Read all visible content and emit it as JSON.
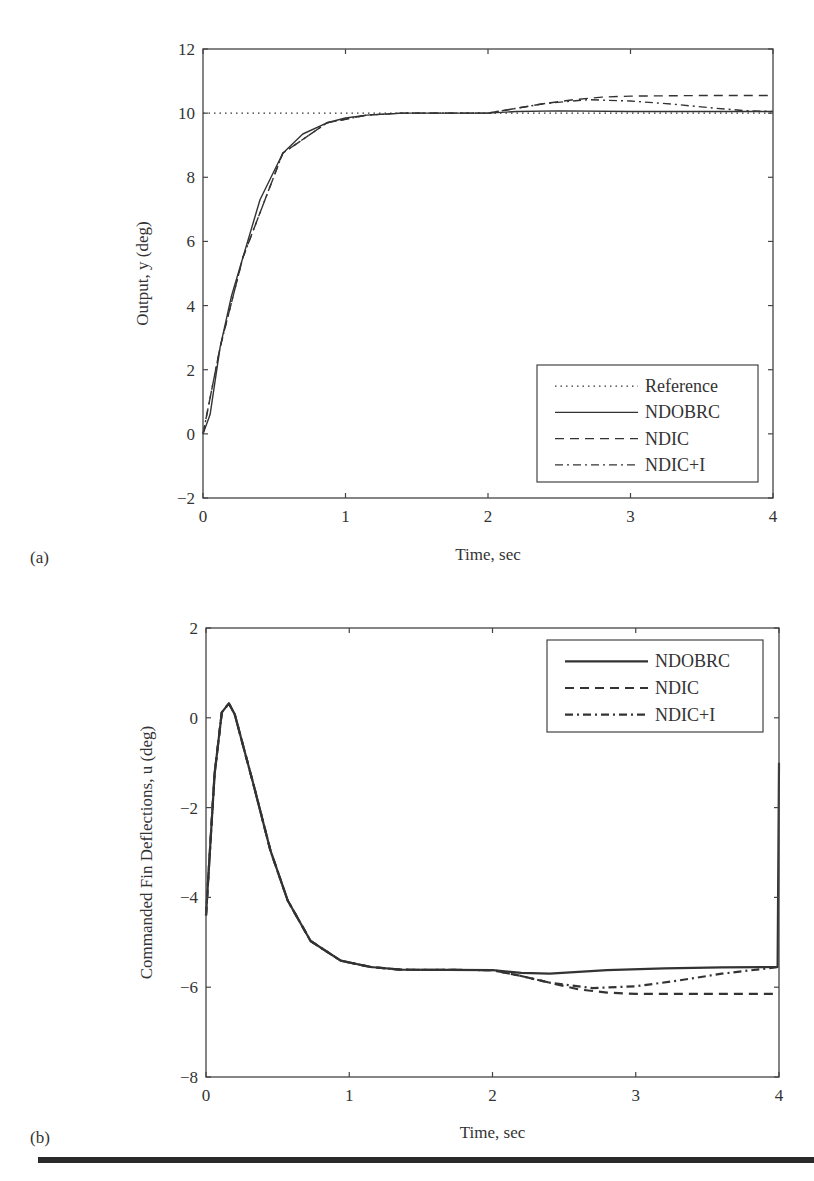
{
  "chart_data": [
    {
      "type": "line",
      "panel_label": "(a)",
      "title": "",
      "xlabel": "Time, sec",
      "ylabel": "Output, y (deg)",
      "xlim": [
        0,
        4
      ],
      "ylim": [
        -2,
        12
      ],
      "xticks": [
        "0",
        "1",
        "2",
        "3",
        "4"
      ],
      "yticks": [
        "-2",
        "0",
        "2",
        "4",
        "6",
        "8",
        "10",
        "12"
      ],
      "grid": false,
      "legend_position": "lower right",
      "series": [
        {
          "name": "Reference",
          "style": "dotted",
          "x": [
            0,
            4
          ],
          "y": [
            10,
            10
          ]
        },
        {
          "name": "NDOBRC",
          "style": "solid",
          "x": [
            0,
            0.05,
            0.12,
            0.2,
            0.28,
            0.4,
            0.56,
            0.7,
            0.87,
            1.0,
            1.15,
            1.4,
            2.0,
            2.2,
            2.5,
            3.0,
            4.0
          ],
          "y": [
            0,
            0.6,
            2.7,
            4.3,
            5.5,
            7.3,
            8.75,
            9.35,
            9.7,
            9.85,
            9.94,
            10.0,
            10.0,
            10.05,
            10.07,
            10.05,
            10.05
          ]
        },
        {
          "name": "NDIC",
          "style": "dashed",
          "x": [
            0,
            0.12,
            0.28,
            0.56,
            0.87,
            1.15,
            1.4,
            2.0,
            2.2,
            2.4,
            2.6,
            2.8,
            3.0,
            3.5,
            4.0
          ],
          "y": [
            0,
            2.7,
            5.5,
            8.75,
            9.7,
            9.94,
            10.0,
            10.0,
            10.15,
            10.3,
            10.42,
            10.5,
            10.53,
            10.55,
            10.55
          ]
        },
        {
          "name": "NDIC+I",
          "style": "dashdot",
          "x": [
            0,
            0.12,
            0.28,
            0.56,
            0.87,
            1.15,
            1.4,
            2.0,
            2.2,
            2.4,
            2.7,
            3.0,
            3.3,
            3.6,
            3.8,
            4.0
          ],
          "y": [
            0,
            2.7,
            5.5,
            8.75,
            9.7,
            9.94,
            10.0,
            10.0,
            10.15,
            10.3,
            10.42,
            10.38,
            10.28,
            10.15,
            10.08,
            10.05
          ]
        }
      ]
    },
    {
      "type": "line",
      "panel_label": "(b)",
      "title": "",
      "xlabel": "Time, sec",
      "ylabel": "Commanded Fin Deflections, u (deg)",
      "xlim": [
        0,
        4
      ],
      "ylim": [
        -8,
        2
      ],
      "xticks": [
        "0",
        "1",
        "2",
        "3",
        "4"
      ],
      "yticks": [
        "-8",
        "-6",
        "-4",
        "-2",
        "0",
        "2"
      ],
      "grid": false,
      "legend_position": "upper right",
      "series": [
        {
          "name": "NDOBRC",
          "style": "solid",
          "x": [
            0,
            0.06,
            0.11,
            0.16,
            0.2,
            0.33,
            0.45,
            0.57,
            0.73,
            0.94,
            1.15,
            1.36,
            2.0,
            2.2,
            2.4,
            2.8,
            3.2,
            3.6,
            3.99,
            4.0
          ],
          "y": [
            -4.4,
            -1.25,
            0.12,
            0.32,
            0.08,
            -1.47,
            -2.96,
            -4.07,
            -4.97,
            -5.41,
            -5.55,
            -5.61,
            -5.62,
            -5.68,
            -5.7,
            -5.62,
            -5.58,
            -5.56,
            -5.55,
            -1.0
          ]
        },
        {
          "name": "NDIC",
          "style": "dashed",
          "x": [
            0,
            0.06,
            0.11,
            0.16,
            0.2,
            0.33,
            0.45,
            0.57,
            0.73,
            0.94,
            1.15,
            1.36,
            2.0,
            2.2,
            2.4,
            2.6,
            2.8,
            3.0,
            3.5,
            4.0
          ],
          "y": [
            -4.4,
            -1.25,
            0.12,
            0.32,
            0.08,
            -1.47,
            -2.96,
            -4.07,
            -4.97,
            -5.41,
            -5.55,
            -5.61,
            -5.62,
            -5.75,
            -5.9,
            -6.05,
            -6.12,
            -6.15,
            -6.15,
            -6.15
          ]
        },
        {
          "name": "NDIC+I",
          "style": "dashdot",
          "x": [
            0,
            0.06,
            0.11,
            0.16,
            0.2,
            0.33,
            0.45,
            0.57,
            0.73,
            0.94,
            1.15,
            1.36,
            2.0,
            2.2,
            2.4,
            2.7,
            3.0,
            3.3,
            3.6,
            4.0
          ],
          "y": [
            -4.4,
            -1.25,
            0.12,
            0.32,
            0.08,
            -1.47,
            -2.96,
            -4.07,
            -4.97,
            -5.41,
            -5.55,
            -5.61,
            -5.62,
            -5.75,
            -5.9,
            -6.02,
            -5.98,
            -5.85,
            -5.7,
            -5.55
          ]
        }
      ]
    }
  ],
  "figure": {
    "panel_a_label": "(a)",
    "panel_b_label": "(b)",
    "colors": {
      "line": "#333333",
      "axis": "#444444",
      "background": "#ffffff"
    }
  }
}
